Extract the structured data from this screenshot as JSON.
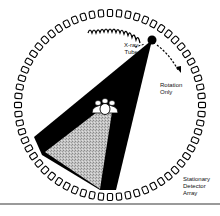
{
  "diagram": {
    "labels": {
      "tube": [
        "X-ray",
        "Tube"
      ],
      "rotation": [
        "Rotation",
        "Only"
      ],
      "detector": [
        "Stationary",
        "Detector",
        "Array"
      ]
    },
    "components": [
      "detector-ring",
      "x-ray-tube",
      "tube-track-coil",
      "fan-beam",
      "patient",
      "rotation-arrow"
    ],
    "colors": {
      "ink": "#000000",
      "paper": "#ffffff",
      "stipple": "#b8b8b8",
      "rule": "#9a9a9a"
    },
    "ring": {
      "cx": 110,
      "cy": 105,
      "r": 92,
      "detector_count": 64
    },
    "tube_position": [
      152,
      40
    ]
  }
}
